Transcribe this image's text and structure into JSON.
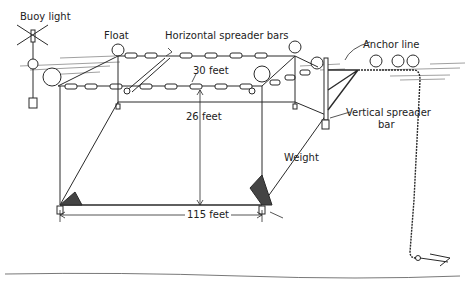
{
  "diagram": {
    "type": "illustration",
    "labels": {
      "buoy_light": "Buoy light",
      "float": "Float",
      "horizontal_spreader_bars": "Horizontal spreader bars",
      "anchor_line": "Anchor line",
      "width_dim": "30 feet",
      "depth_dim": "26 feet",
      "length_dim": "115 feet",
      "vertical_spreader_bar_line1": "Vertical spreader",
      "vertical_spreader_bar_line2": "bar",
      "weight": "Weight"
    },
    "colors": {
      "ink": "#2a2a2a",
      "background": "#ffffff"
    }
  }
}
